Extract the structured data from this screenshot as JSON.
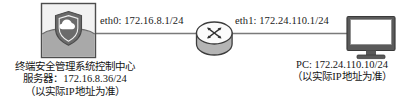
{
  "diagram": {
    "type": "network-topology",
    "background_color": "#ffffff",
    "line_color": "#7a7a7a",
    "nodes": [
      {
        "id": "server",
        "icon": "server-shield-cloud-icon",
        "caption_lines": [
          "终端安全管理系统控制中心",
          "服务器：172.16.8.36/24",
          "（以实际IP地址为准）"
        ],
        "ip": "172.16.8.36/24",
        "colors": {
          "box_top": "#f2f2f2",
          "box_bottom": "#a9a9a9",
          "border": "#4d4d4d",
          "shield": "#6b6b6b",
          "cloud": "#ffffff"
        }
      },
      {
        "id": "router",
        "icon": "router-icon",
        "colors": {
          "top": "#fbfbfb",
          "body": "#b5b5b5",
          "border": "#3d3d3d",
          "arrows": "#333333"
        }
      },
      {
        "id": "pc",
        "icon": "monitor-icon",
        "caption_lines": [
          "PC: 172.24.110.10/24",
          "（以实际IP地址为准）"
        ],
        "ip": "172.24.110.10/24",
        "colors": {
          "bezel": "#5a5a5a",
          "screen": "#ffffff",
          "stand": "#5a5a5a"
        }
      }
    ],
    "links": [
      {
        "id": "eth0",
        "label": "eth0: 172.16.8.1/24",
        "from": "server",
        "to": "router"
      },
      {
        "id": "eth1",
        "label": "eth1: 172.24.110.1/24",
        "from": "router",
        "to": "pc"
      }
    ]
  }
}
